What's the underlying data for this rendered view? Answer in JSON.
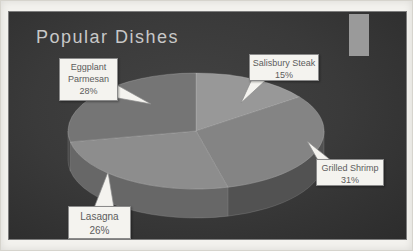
{
  "slide": {
    "title": "Popular Dishes",
    "background_color": "#3a3a3a",
    "title_color": "#c8c8c8",
    "deco_rect_color": "#9a9a9a",
    "frame_color": "#f3f2ee"
  },
  "chart_data": {
    "type": "pie",
    "style": "3d",
    "title": "Popular Dishes",
    "unit": "%",
    "total": 100,
    "start_angle_deg": 0,
    "direction": "clockwise",
    "legend_position": "none",
    "categories": [
      "Salisbury Steak",
      "Grilled Shrimp",
      "Lasagna",
      "Eggplant Parmesan"
    ],
    "values": [
      15,
      31,
      26,
      28
    ],
    "slices": [
      {
        "label": "Salisbury Steak",
        "value": 15,
        "display": "15%",
        "color": "#989898",
        "side_color": "#5f5f5f"
      },
      {
        "label": "Grilled Shrimp",
        "value": 31,
        "display": "31%",
        "color": "#848484",
        "side_color": "#525252"
      },
      {
        "label": "Lasagna",
        "value": 26,
        "display": "26%",
        "color": "#8d8d8d",
        "side_color": "#676767"
      },
      {
        "label": "Eggplant Parmesan",
        "value": 28,
        "display": "28%",
        "color": "#757575",
        "side_color": "#474747"
      }
    ],
    "callouts": [
      {
        "name": "eggplant-parmesan",
        "lines": [
          "Eggplant",
          "Parmesan",
          "28%"
        ]
      },
      {
        "name": "salisbury-steak",
        "lines": [
          "Salisbury Steak",
          "15%"
        ]
      },
      {
        "name": "grilled-shrimp",
        "lines": [
          "Grilled Shrimp",
          "31%"
        ]
      },
      {
        "name": "lasagna",
        "lines": [
          "Lasagna",
          "26%"
        ]
      }
    ]
  }
}
